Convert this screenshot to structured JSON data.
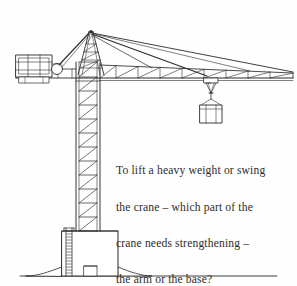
{
  "page": {
    "background_color": "#fefefe",
    "width": 297,
    "height": 286
  },
  "illustration": {
    "name": "tower-crane-line-drawing",
    "stroke_color": "#2b2b2b",
    "fill_color": "#ffffff",
    "parts": {
      "mast_label": "tower mast",
      "jib_label": "jib arm",
      "counter_jib_label": "counter jib",
      "counterweight_label": "counterweight",
      "apex_label": "tower top A-frame",
      "trolley_label": "trolley",
      "load_label": "suspended load",
      "base_label": "concrete base",
      "ladder_label": "access ladder",
      "ground_label": "ground line"
    }
  },
  "question": {
    "lines": [
      "To lift a heavy weight or swing",
      "the crane – which part of the",
      "crane needs strengthening –",
      "the arm or the base?"
    ],
    "full_text": "To lift a heavy weight or swing the crane – which part of the crane needs strengthening – the arm or the base?",
    "text_color": "#2e2c2b"
  }
}
